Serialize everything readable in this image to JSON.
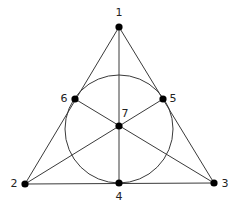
{
  "diagram": {
    "type": "fano-plane",
    "width": 239,
    "height": 210,
    "colors": {
      "line": "#3a3a3a",
      "point": "#000000",
      "label": "#222222",
      "background": "#ffffff"
    },
    "points": [
      {
        "id": "1",
        "label": "1",
        "x": 119,
        "y": 27,
        "label_x": 119,
        "label_y": 13
      },
      {
        "id": "2",
        "label": "2",
        "x": 25,
        "y": 184,
        "label_x": 14,
        "label_y": 184
      },
      {
        "id": "3",
        "label": "3",
        "x": 214,
        "y": 183,
        "label_x": 225,
        "label_y": 184
      },
      {
        "id": "4",
        "label": "4",
        "x": 119,
        "y": 183,
        "label_x": 119,
        "label_y": 197
      },
      {
        "id": "5",
        "label": "5",
        "x": 163,
        "y": 99,
        "label_x": 173,
        "label_y": 99
      },
      {
        "id": "6",
        "label": "6",
        "x": 75,
        "y": 99,
        "label_x": 64,
        "label_y": 99
      },
      {
        "id": "7",
        "label": "7",
        "x": 119,
        "y": 126,
        "label_x": 125,
        "label_y": 114
      }
    ],
    "lines": [
      {
        "name": "line-1-6-2",
        "from": "1",
        "to": "2",
        "through": [
          "6"
        ]
      },
      {
        "name": "line-1-5-3",
        "from": "1",
        "to": "3",
        "through": [
          "5"
        ]
      },
      {
        "name": "line-2-4-3",
        "from": "2",
        "to": "3",
        "through": [
          "4"
        ]
      },
      {
        "name": "line-1-7-4",
        "from": "1",
        "to": "4",
        "through": [
          "7"
        ]
      },
      {
        "name": "line-2-7-5",
        "from": "2",
        "to": "5",
        "through": [
          "7"
        ]
      },
      {
        "name": "line-3-7-6",
        "from": "3",
        "to": "6",
        "through": [
          "7"
        ]
      }
    ],
    "circle": {
      "name": "line-4-5-6-circle",
      "through": [
        "4",
        "5",
        "6"
      ],
      "cx": 119,
      "cy": 129,
      "r": 54
    }
  }
}
